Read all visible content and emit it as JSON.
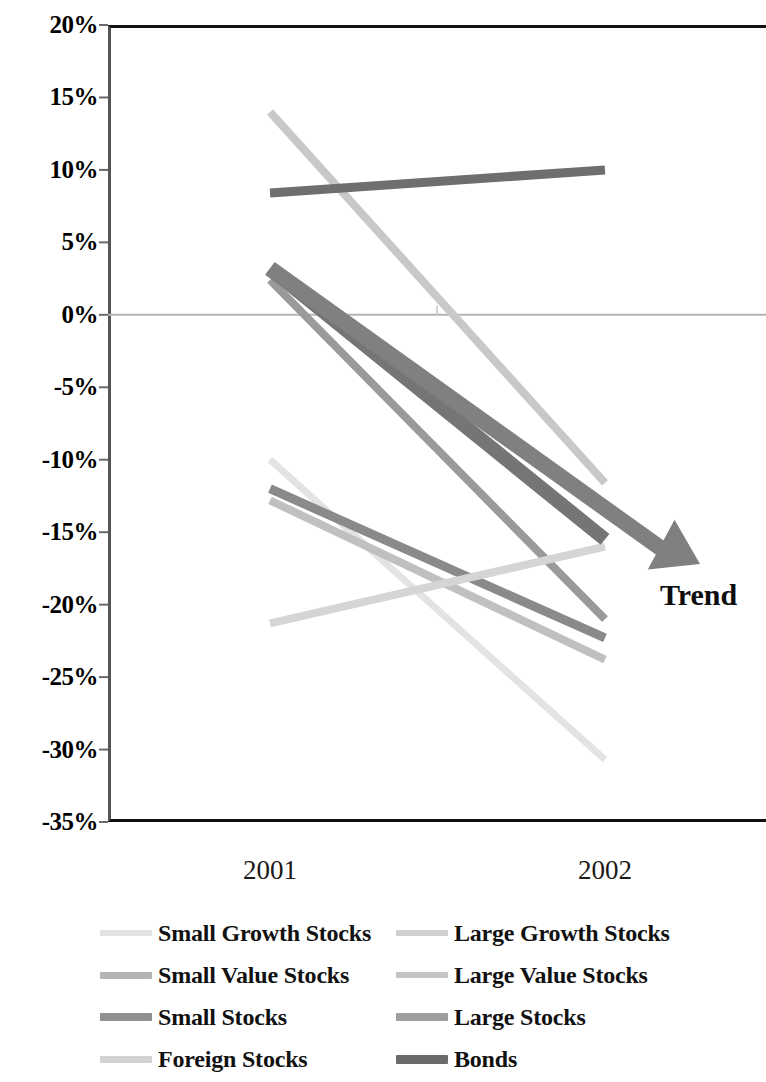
{
  "chart_data": {
    "type": "line",
    "title": "",
    "subtitle": "",
    "xlabel": "",
    "ylabel": "",
    "categories": [
      "2001",
      "2002"
    ],
    "x_tick_labels": [
      "2001",
      "2002"
    ],
    "y_tick_labels": [
      "20%",
      "15%",
      "10%",
      "5%",
      "0%",
      "-5%",
      "-10%",
      "-15%",
      "-20%",
      "-25%",
      "-30%",
      "-35%"
    ],
    "y_tick_values": [
      20,
      15,
      10,
      5,
      0,
      -5,
      -10,
      -15,
      -20,
      -25,
      -30,
      -35
    ],
    "ylim": [
      -35,
      20
    ],
    "grid": "zero-line-only",
    "legend_position": "bottom",
    "legend_columns": 2,
    "series": [
      {
        "name": "Small Growth Stocks",
        "values": [
          -10.0,
          -30.7
        ],
        "color": "#e3e3e3",
        "width": 7
      },
      {
        "name": "Large Growth Stocks",
        "values": [
          14.0,
          -11.6
        ],
        "color": "#c8c8c8",
        "width": 8
      },
      {
        "name": "Small Value Stocks",
        "values": [
          2.4,
          -21.0
        ],
        "color": "#9a9a9a",
        "width": 8
      },
      {
        "name": "Large Value Stocks",
        "values": [
          -12.8,
          -23.8
        ],
        "color": "#c0c0c0",
        "width": 8
      },
      {
        "name": "Small Stocks",
        "values": [
          -12.0,
          -22.3
        ],
        "color": "#8a8a8a",
        "width": 9
      },
      {
        "name": "Large Stocks",
        "values": [
          8.4,
          10.0
        ],
        "color": "#6e6e6e",
        "width": 9
      },
      {
        "name": "Foreign Stocks",
        "values": [
          -21.3,
          -16.0
        ],
        "color": "#d5d5d5",
        "width": 8
      },
      {
        "name": "Bonds",
        "values": [
          3.2,
          -15.5
        ],
        "color": "#757575",
        "width": 14
      }
    ],
    "annotations": [
      {
        "name": "trend-arrow",
        "label": "Trend",
        "from": [
          2001,
          3.2
        ],
        "to": [
          2002.2,
          -17.2
        ],
        "color": "#808080"
      }
    ]
  },
  "legend": {
    "items": [
      {
        "label": "Small Growth Stocks",
        "color": "#e3e3e3",
        "height": 6
      },
      {
        "label": "Large Growth Stocks",
        "color": "#cfcfcf",
        "height": 6
      },
      {
        "label": "Small Value Stocks",
        "color": "#b4b4b4",
        "height": 7
      },
      {
        "label": "Large Value Stocks",
        "color": "#c5c5c5",
        "height": 6
      },
      {
        "label": "Small Stocks",
        "color": "#8f8f8f",
        "height": 8
      },
      {
        "label": "Large Stocks",
        "color": "#9e9e9e",
        "height": 8
      },
      {
        "label": "Foreign Stocks",
        "color": "#d2d2d2",
        "height": 7
      },
      {
        "label": "Bonds",
        "color": "#6b6b6b",
        "height": 9
      }
    ]
  },
  "axis": {
    "zero_line_color": "#b5b5b5",
    "frame_color": "#111111"
  }
}
